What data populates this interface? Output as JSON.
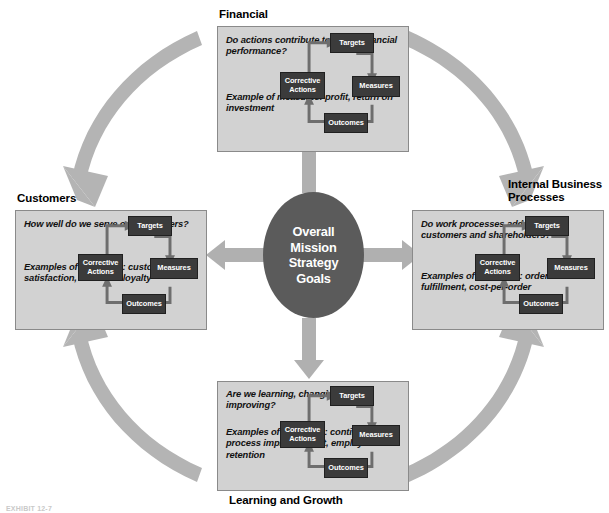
{
  "figure": {
    "kind": "balanced-scorecard-diagram",
    "caption": "EXHIBIT 12-7"
  },
  "center": {
    "label": "Overall\nMission\nStrategy\nGoals",
    "fill": "#5b5b5b",
    "text_color": "#ffffff"
  },
  "cycle": {
    "nodes": {
      "targets": "Targets",
      "measures": "Measures",
      "outcomes": "Outcomes",
      "corrective": "Corrective\nActions"
    },
    "order": [
      "Targets",
      "Measures",
      "Outcomes",
      "Corrective Actions"
    ],
    "node_fill": "#3b3b3b",
    "node_text_color": "#ffffff"
  },
  "panels": {
    "financial": {
      "title": "Financial",
      "question": "Do actions\ncontribute to\nbetter financial\nperformance?",
      "examples": "Example of\nmeasures: profit,\nreturn on\ninvestment"
    },
    "customers": {
      "title": "Customers",
      "question": "How well do we\nserve our\ncustomers?",
      "examples": "Examples of\nmeasures:\ncustomer\nsatisfaction,\ncustomer loyalty"
    },
    "internal": {
      "title": "Internal Business\nProcesses",
      "question": "Do work processes\nadd value for\ncustomers and\nshareholders?",
      "examples": "Examples of\nmeasures: order-\nrate fulfillment,\ncost-per-order"
    },
    "learning": {
      "title": "Learning and Growth",
      "question": "Are we learning,\nchanging, and\nimproving?",
      "examples": "Examples of\nmeasures:\ncontinuous\nprocess improve-\nment, employee\nretention"
    }
  },
  "colors": {
    "panel_bg": "#d2d2d2",
    "panel_border": "#8a8a8a",
    "arc_gray": "#b3b3b3",
    "arrow_gray": "#b0b0b0",
    "node_dark": "#3b3b3b"
  },
  "arcs": {
    "financial_to_customers": "clockwise arc from Financial panel down-left to Customers panel",
    "financial_to_internal": "clockwise arc from Financial panel down-right to Internal Business Processes panel",
    "learning_to_customers": "arc from Learning and Growth panel up-left to Customers panel",
    "learning_to_internal": "arc from Learning and Growth panel up-right to Internal Business Processes panel"
  },
  "spokes": {
    "up": "center to Financial",
    "down": "center to Learning and Growth",
    "left": "center to Customers",
    "right": "center to Internal Business Processes"
  }
}
